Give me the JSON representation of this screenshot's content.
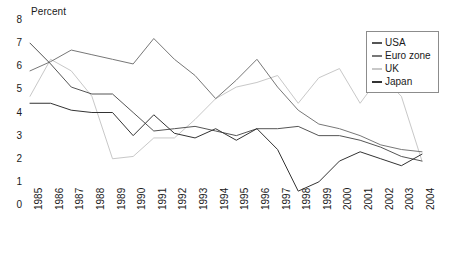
{
  "chart_data": {
    "type": "line",
    "title": "",
    "ylabel": "Percent",
    "xlabel": "",
    "ylim": [
      0,
      8
    ],
    "ytick_step": 1,
    "grid": false,
    "legend_position": "top-right",
    "x": [
      1985,
      1986,
      1987,
      1988,
      1989,
      1990,
      1991,
      1992,
      1993,
      1994,
      1995,
      1996,
      1997,
      1998,
      1999,
      2000,
      2001,
      2002,
      2003,
      2004
    ],
    "xtick_labels": [
      "1985",
      "1986",
      "1987",
      "1988",
      "1989",
      "1990",
      "1991",
      "1992",
      "1993",
      "1994",
      "1995",
      "1996",
      "1997",
      "1998",
      "1999",
      "2000",
      "2001",
      "2002",
      "2003",
      "2004"
    ],
    "ytick_labels": [
      "0",
      "1",
      "2",
      "3",
      "4",
      "5",
      "6",
      "7",
      "8"
    ],
    "series": [
      {
        "name": "USA",
        "color": "#555555",
        "values": [
          7.0,
          6.1,
          5.1,
          4.8,
          4.8,
          4.0,
          3.2,
          3.3,
          3.4,
          3.2,
          3.0,
          3.3,
          3.3,
          3.4,
          3.0,
          3.0,
          2.8,
          2.5,
          2.1,
          1.9
        ]
      },
      {
        "name": "Euro zone",
        "color": "#777777",
        "values": [
          5.8,
          6.2,
          6.7,
          6.5,
          6.3,
          6.1,
          7.2,
          6.3,
          5.6,
          4.6,
          5.4,
          6.3,
          5.1,
          4.1,
          3.5,
          3.3,
          3.0,
          2.6,
          2.4,
          2.3
        ]
      },
      {
        "name": "UK",
        "color": "#c8c8c8",
        "values": [
          4.7,
          6.3,
          5.8,
          4.7,
          2.0,
          2.1,
          2.9,
          2.9,
          3.7,
          4.6,
          5.1,
          5.3,
          5.6,
          4.4,
          5.5,
          5.9,
          4.4,
          5.6,
          4.7,
          1.9
        ]
      },
      {
        "name": "Japan",
        "color": "#333333",
        "values": [
          4.4,
          4.4,
          4.1,
          4.0,
          4.0,
          3.0,
          3.9,
          3.1,
          2.9,
          3.3,
          2.8,
          3.3,
          2.4,
          0.6,
          1.0,
          1.9,
          2.3,
          2.0,
          1.7,
          2.2
        ]
      }
    ]
  },
  "legend": {
    "items": [
      {
        "label": "USA"
      },
      {
        "label": "Euro zone"
      },
      {
        "label": "UK"
      },
      {
        "label": "Japan"
      }
    ]
  }
}
